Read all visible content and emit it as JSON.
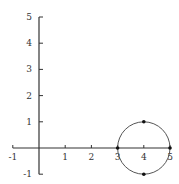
{
  "chart_data": {
    "type": "line",
    "title": "",
    "xlabel": "",
    "ylabel": "",
    "xlim": [
      -1,
      5
    ],
    "ylim": [
      -1,
      5
    ],
    "grid": false,
    "x_ticks": [
      "-1",
      "1",
      "2",
      "3",
      "4",
      "5"
    ],
    "y_ticks": [
      "-1",
      "1",
      "2",
      "3",
      "4",
      "5"
    ],
    "circle": {
      "center": [
        4,
        0
      ],
      "radius": 1
    },
    "points": [
      {
        "x": 3,
        "y": 0
      },
      {
        "x": 5,
        "y": 0
      },
      {
        "x": 4,
        "y": 1
      },
      {
        "x": 4,
        "y": -1
      }
    ],
    "colors": {
      "axis": "#333333",
      "circle": "#555555",
      "point": "#111111"
    }
  }
}
